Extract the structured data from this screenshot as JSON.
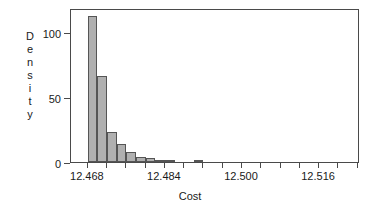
{
  "chart_data": {
    "type": "bar",
    "title": "",
    "subtitle": "",
    "xlabel": "Cost",
    "ylabel": "Density",
    "ylabel_letters": [
      "D",
      "e",
      "n",
      "s",
      "i",
      "t",
      "y"
    ],
    "grid": false,
    "legend": "none",
    "xlim": [
      12.4645,
      12.5245
    ],
    "ylim": [
      0,
      122
    ],
    "bin_width": 0.002,
    "x_ticks": [
      {
        "value": 12.468,
        "label": "12.468"
      },
      {
        "value": 12.472,
        "label": ""
      },
      {
        "value": 12.476,
        "label": ""
      },
      {
        "value": 12.48,
        "label": ""
      },
      {
        "value": 12.484,
        "label": "12.484"
      },
      {
        "value": 12.488,
        "label": ""
      },
      {
        "value": 12.492,
        "label": ""
      },
      {
        "value": 12.496,
        "label": ""
      },
      {
        "value": 12.5,
        "label": "12.500"
      },
      {
        "value": 12.504,
        "label": ""
      },
      {
        "value": 12.508,
        "label": ""
      },
      {
        "value": 12.512,
        "label": ""
      },
      {
        "value": 12.516,
        "label": "12.516"
      },
      {
        "value": 12.52,
        "label": ""
      },
      {
        "value": 12.524,
        "label": ""
      }
    ],
    "y_ticks": [
      {
        "value": 0,
        "label": "0"
      },
      {
        "value": 50,
        "label": "50"
      },
      {
        "value": 100,
        "label": "100"
      }
    ],
    "bins": [
      {
        "x0": 12.468,
        "x1": 12.47,
        "value": 116
      },
      {
        "x0": 12.47,
        "x1": 12.472,
        "value": 68
      },
      {
        "x0": 12.472,
        "x1": 12.474,
        "value": 24
      },
      {
        "x0": 12.474,
        "x1": 12.476,
        "value": 14
      },
      {
        "x0": 12.476,
        "x1": 12.478,
        "value": 8
      },
      {
        "x0": 12.478,
        "x1": 12.48,
        "value": 4
      },
      {
        "x0": 12.48,
        "x1": 12.482,
        "value": 3
      },
      {
        "x0": 12.482,
        "x1": 12.484,
        "value": 1
      },
      {
        "x0": 12.484,
        "x1": 12.486,
        "value": 1
      },
      {
        "x0": 12.49,
        "x1": 12.492,
        "value": 1
      }
    ],
    "categories": [
      "12.468-12.470",
      "12.470-12.472",
      "12.472-12.474",
      "12.474-12.476",
      "12.476-12.478",
      "12.478-12.480",
      "12.480-12.482",
      "12.482-12.484",
      "12.484-12.486",
      "12.490-12.492"
    ],
    "values": [
      116,
      68,
      24,
      14,
      8,
      4,
      3,
      1,
      1,
      1
    ],
    "colors": {
      "bar_fill": "#b0b0b0",
      "bar_stroke": "#555555",
      "axis": "#4a4a4a",
      "text": "#1a1a1a",
      "background": "#ffffff"
    }
  }
}
